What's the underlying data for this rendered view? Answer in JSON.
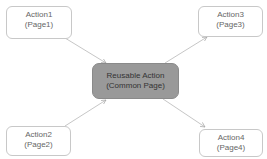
{
  "diagram": {
    "nodes": [
      {
        "id": "action1",
        "line1": "Action1",
        "line2": "(Page1)"
      },
      {
        "id": "action2",
        "line1": "Action2",
        "line2": "(Page2)"
      },
      {
        "id": "action3",
        "line1": "Action3",
        "line2": "(Page3)"
      },
      {
        "id": "action4",
        "line1": "Action4",
        "line2": "(Page4)"
      },
      {
        "id": "reusable",
        "line1": "Reusable Action",
        "line2": "(Common Page)"
      }
    ],
    "edges": [
      {
        "from": "action1",
        "to": "reusable"
      },
      {
        "from": "action2",
        "to": "reusable"
      },
      {
        "from": "reusable",
        "to": "action3"
      },
      {
        "from": "reusable",
        "to": "action4"
      }
    ],
    "colors": {
      "center_fill": "#999999",
      "node_border": "#c8c8c8",
      "edge": "#b0b0b0"
    }
  }
}
